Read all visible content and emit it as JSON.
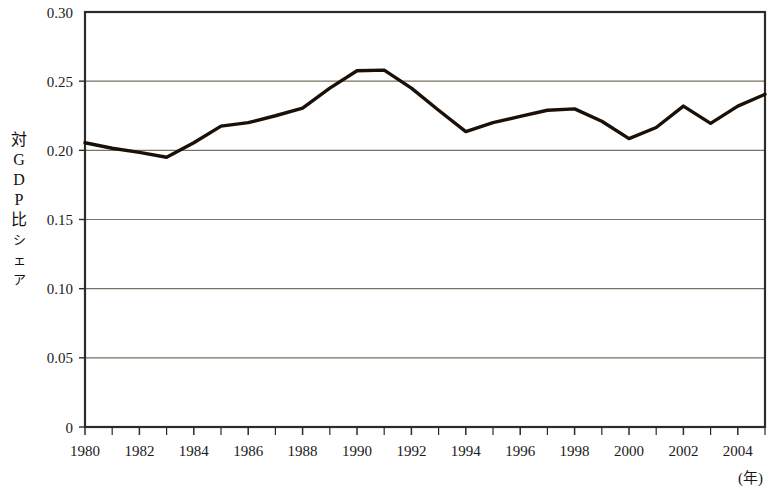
{
  "chart_data": {
    "type": "line",
    "title": "",
    "subtitle": "",
    "xlabel": "(年)",
    "ylabel": "対GDP比シェア",
    "ylabel_chars": [
      "対",
      "G",
      "D",
      "P",
      "比",
      "シ",
      "ェ",
      "ア"
    ],
    "xlim": [
      1980,
      2005
    ],
    "ylim": [
      0,
      0.3
    ],
    "ytick_labels": [
      "0.30",
      "0.25",
      "0.20",
      "0.15",
      "0.10",
      "0.05",
      "0"
    ],
    "ytick_values": [
      0.3,
      0.25,
      0.2,
      0.15,
      0.1,
      0.05,
      0
    ],
    "xtick_labels": [
      "1980",
      "1982",
      "1984",
      "1986",
      "1988",
      "1990",
      "1992",
      "1994",
      "1996",
      "1998",
      "2000",
      "2002",
      "2004"
    ],
    "xtick_values": [
      1980,
      1982,
      1984,
      1986,
      1988,
      1990,
      1992,
      1994,
      1996,
      1998,
      2000,
      2002,
      2004
    ],
    "minor_xticks": [
      1981,
      1983,
      1985,
      1987,
      1989,
      1991,
      1993,
      1995,
      1997,
      1999,
      2001,
      2003,
      2005
    ],
    "grid": "horizontal",
    "legend": "none",
    "x": [
      1980,
      1981,
      1982,
      1983,
      1984,
      1985,
      1986,
      1987,
      1988,
      1989,
      1990,
      1991,
      1992,
      1993,
      1994,
      1995,
      1996,
      1997,
      1998,
      1999,
      2000,
      2001,
      2002,
      2003,
      2004,
      2005
    ],
    "series": [
      {
        "name": "対GDP比シェア",
        "color": "#1a1008",
        "values": [
          0.2055,
          0.2015,
          0.1985,
          0.195,
          0.2055,
          0.2175,
          0.22,
          0.225,
          0.2305,
          0.245,
          0.2575,
          0.258,
          0.245,
          0.229,
          0.2135,
          0.22,
          0.2245,
          0.229,
          0.23,
          0.221,
          0.2085,
          0.2165,
          0.232,
          0.2195,
          0.232,
          0.2405
        ]
      }
    ]
  },
  "axes": {
    "frame_color": "#2b2b2b",
    "grid_color": "#7a7262",
    "line_color": "#1a1008"
  }
}
